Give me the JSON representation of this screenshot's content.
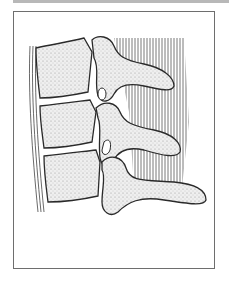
{
  "figure": {
    "frame_color": "#6e6e6e",
    "top_rule_color": "#b8b8b8",
    "bone_fill": "#f2f2f2",
    "outline_color": "#2a2a2a"
  }
}
